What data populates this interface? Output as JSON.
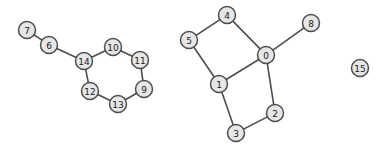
{
  "figure": {
    "type": "node-link-graph",
    "width": 382,
    "height": 152,
    "background_color": "#ffffff",
    "node_fill_color": "#e6e6e6",
    "node_stroke_color": "#4d4d4d",
    "edge_color": "#4d4d4d",
    "label_color": "#1a1a1a",
    "node_radius": 8.5
  },
  "nodes": [
    {
      "id": "0",
      "label": "0",
      "x": 266,
      "y": 55
    },
    {
      "id": "1",
      "label": "1",
      "x": 219,
      "y": 84
    },
    {
      "id": "2",
      "label": "2",
      "x": 275,
      "y": 113
    },
    {
      "id": "3",
      "label": "3",
      "x": 236,
      "y": 133
    },
    {
      "id": "4",
      "label": "4",
      "x": 227,
      "y": 15
    },
    {
      "id": "5",
      "label": "5",
      "x": 189,
      "y": 40
    },
    {
      "id": "6",
      "label": "6",
      "x": 49,
      "y": 45
    },
    {
      "id": "7",
      "label": "7",
      "x": 27,
      "y": 30
    },
    {
      "id": "8",
      "label": "8",
      "x": 311,
      "y": 23
    },
    {
      "id": "9",
      "label": "9",
      "x": 144,
      "y": 89
    },
    {
      "id": "10",
      "label": "10",
      "x": 113,
      "y": 47
    },
    {
      "id": "11",
      "label": "11",
      "x": 140,
      "y": 60
    },
    {
      "id": "12",
      "label": "12",
      "x": 90,
      "y": 91
    },
    {
      "id": "13",
      "label": "13",
      "x": 118,
      "y": 104
    },
    {
      "id": "14",
      "label": "14",
      "x": 84,
      "y": 61
    },
    {
      "id": "15",
      "label": "15",
      "x": 360,
      "y": 68
    }
  ],
  "edges": [
    {
      "source": "7",
      "target": "6"
    },
    {
      "source": "6",
      "target": "14"
    },
    {
      "source": "14",
      "target": "10"
    },
    {
      "source": "10",
      "target": "11"
    },
    {
      "source": "11",
      "target": "9"
    },
    {
      "source": "9",
      "target": "13"
    },
    {
      "source": "13",
      "target": "12"
    },
    {
      "source": "12",
      "target": "14"
    },
    {
      "source": "4",
      "target": "5"
    },
    {
      "source": "4",
      "target": "0"
    },
    {
      "source": "5",
      "target": "1"
    },
    {
      "source": "1",
      "target": "0"
    },
    {
      "source": "0",
      "target": "8"
    },
    {
      "source": "0",
      "target": "2"
    },
    {
      "source": "1",
      "target": "3"
    },
    {
      "source": "3",
      "target": "2"
    }
  ],
  "components": [
    {
      "name": "left-cycle-component",
      "members": [
        "7",
        "6",
        "14",
        "10",
        "11",
        "9",
        "13",
        "12"
      ]
    },
    {
      "name": "right-component",
      "members": [
        "4",
        "5",
        "0",
        "1",
        "2",
        "3",
        "8"
      ]
    },
    {
      "name": "isolated-node",
      "members": [
        "15"
      ]
    }
  ]
}
